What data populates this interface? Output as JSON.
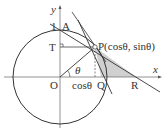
{
  "diagram": {
    "labels": {
      "y_axis": "y",
      "x_axis": "x",
      "one": "1",
      "A": "A",
      "T": "T",
      "O": "O",
      "P": "P(cosθ, sinθ)",
      "theta": "θ",
      "cos_theta": "cosθ",
      "Q": "Q",
      "R": "R"
    },
    "point_P": {
      "angle_label": "θ",
      "coordinates": "(cosθ, sinθ)"
    },
    "shaded_region": "triangle PQR",
    "colors": {
      "line": "#333333",
      "axis": "#777777",
      "shade": "#cccccc",
      "background": "#ffffff"
    }
  }
}
